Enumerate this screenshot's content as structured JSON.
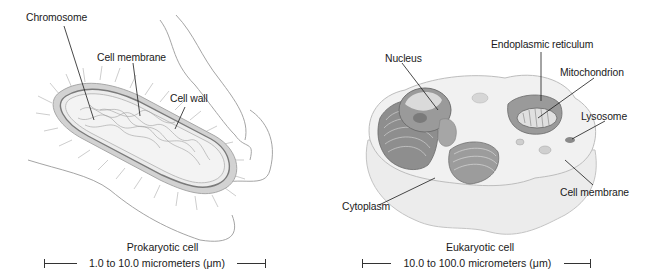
{
  "prokaryotic": {
    "title": "Prokaryotic cell",
    "scale": "1.0 to 10.0 micrometers (μm)",
    "labels": {
      "chromosome": "Chromosome",
      "cell_membrane": "Cell membrane",
      "cell_wall": "Cell wall"
    }
  },
  "eukaryotic": {
    "title": "Eukaryotic cell",
    "scale": "10.0 to 100.0 micrometers (μm)",
    "labels": {
      "nucleus": "Nucleus",
      "endoplasmic_reticulum": "Endoplasmic reticulum",
      "mitochondrion": "Mitochondrion",
      "lysosome": "Lysosome",
      "cell_membrane": "Cell membrane",
      "cytoplasm": "Cytoplasm"
    }
  },
  "colors": {
    "ink": "#1a1a1a",
    "cell_fill": "#e6e6e6",
    "cell_shadow": "#bdbdbd",
    "organelle": "#8a8a8a"
  }
}
